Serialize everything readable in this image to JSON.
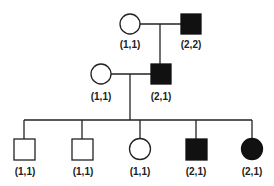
{
  "diagram": {
    "type": "pedigree",
    "colors": {
      "affected": "#111111",
      "unaffected": "#ffffff",
      "line": "#222222"
    },
    "generations": [
      {
        "index": 1,
        "individuals": [
          {
            "id": "g1-female",
            "sex": "female",
            "affected": false,
            "genotype": "(1,1)"
          },
          {
            "id": "g1-male",
            "sex": "male",
            "affected": true,
            "genotype": "(2,2)"
          }
        ]
      },
      {
        "index": 2,
        "individuals": [
          {
            "id": "g2-female",
            "sex": "female",
            "affected": false,
            "genotype": "(1,1)"
          },
          {
            "id": "g2-male",
            "sex": "male",
            "affected": true,
            "genotype": "(2,1)"
          }
        ]
      },
      {
        "index": 3,
        "individuals": [
          {
            "id": "g3-child1",
            "sex": "male",
            "affected": false,
            "genotype": "(1,1)"
          },
          {
            "id": "g3-child2",
            "sex": "male",
            "affected": false,
            "genotype": "(1,1)"
          },
          {
            "id": "g3-child3",
            "sex": "female",
            "affected": false,
            "genotype": "(1,1)"
          },
          {
            "id": "g3-child4",
            "sex": "male",
            "affected": true,
            "genotype": "(2,1)"
          },
          {
            "id": "g3-child5",
            "sex": "female",
            "affected": true,
            "genotype": "(2,1)"
          }
        ]
      }
    ]
  }
}
